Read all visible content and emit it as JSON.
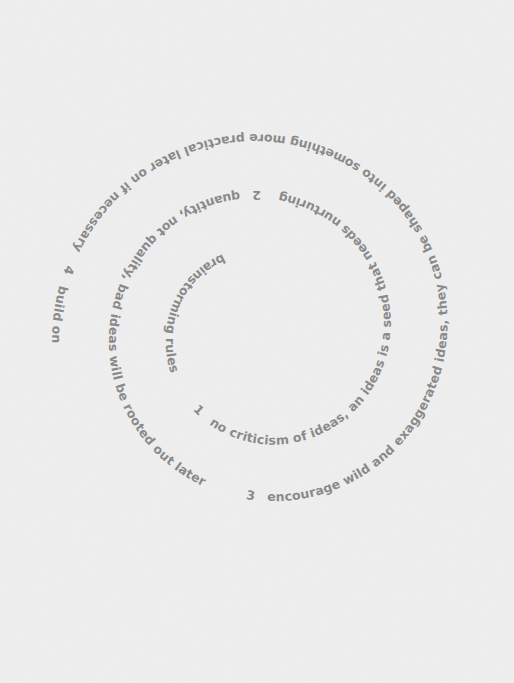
{
  "artwork": {
    "title": "brainstorming rules",
    "rules": [
      {
        "number": "1",
        "text": "no criticism of ideas, an ideas is a seed that needs nurturing"
      },
      {
        "number": "2",
        "text": "quantity, not quality, bad ideas will be rooted out later"
      },
      {
        "number": "3",
        "text": "encourage wild and exaggerated ideas, they can be shaped into something more practical later on if necessary"
      },
      {
        "number": "4",
        "text": "build on each other's ideas, help, don't hinder"
      },
      {
        "number": "5",
        "text": "equal status for all, everyone is creative and capable of having good ideas"
      }
    ]
  },
  "colors": {
    "background": "#ececec",
    "text": "#8a8a8a"
  }
}
